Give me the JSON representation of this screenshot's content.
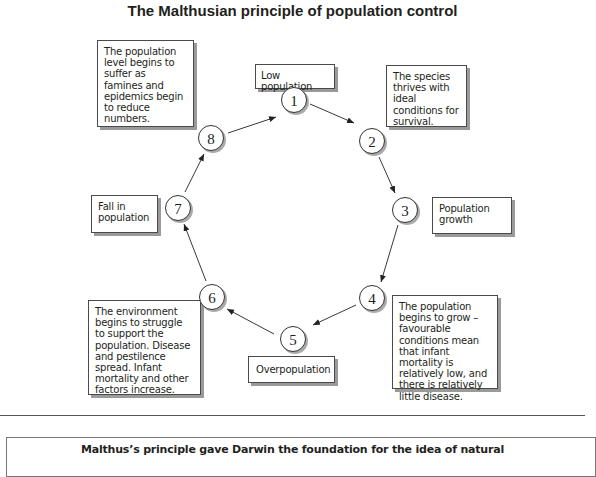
{
  "title": "The Malthusian principle of population control",
  "nodes": [
    {
      "number": "1",
      "label": "Low population"
    },
    {
      "number": "2",
      "label": "The species thrives with ideal conditions for survival."
    },
    {
      "number": "3",
      "label": "Population growth"
    },
    {
      "number": "4",
      "label": "The population begins to  grow – favourable conditions mean that infant mortality is relatively low, and there is relatively little disease."
    },
    {
      "number": "5",
      "label": "Overpopulation"
    },
    {
      "number": "6",
      "label": "The environment begins to struggle to support the population. Disease and pestilence spread. Infant mortality and other factors increase."
    },
    {
      "number": "7",
      "label": "Fall in population"
    },
    {
      "number": "8",
      "label": "The population level begins to suffer as famines and epidemics begin to reduce numbers."
    }
  ],
  "edges": [
    [
      "1",
      "2"
    ],
    [
      "2",
      "3"
    ],
    [
      "3",
      "4"
    ],
    [
      "4",
      "5"
    ],
    [
      "5",
      "6"
    ],
    [
      "6",
      "7"
    ],
    [
      "7",
      "8"
    ],
    [
      "8",
      "1"
    ]
  ],
  "footer": {
    "text": "Malthus’s principle gave Darwin the foundation for the idea of natural"
  }
}
